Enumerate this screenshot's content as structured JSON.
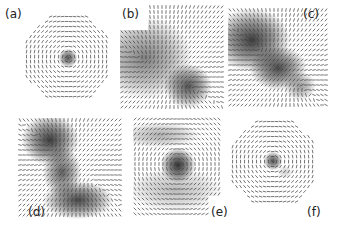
{
  "figure": {
    "panels": [
      {
        "id": "a",
        "label": "(a)",
        "shape": "octagon",
        "cx": 68,
        "cy": 58,
        "r": 47,
        "label_x": 5,
        "label_y": 8,
        "blobs": [
          {
            "x": 68,
            "y": 58,
            "rx": 6,
            "ry": 6,
            "a": 0.75
          }
        ],
        "vortices": [
          {
            "x": 68,
            "y": 58,
            "s": 1
          }
        ]
      },
      {
        "id": "b",
        "label": "(b)",
        "shape": "notched",
        "x0": 120,
        "y0": 5,
        "x1": 225,
        "y1": 110,
        "notch_x": 148,
        "notch_y": 30,
        "label_x": 122,
        "label_y": 8,
        "blobs": [
          {
            "x": 145,
            "y": 58,
            "rx": 30,
            "ry": 26,
            "a": 0.55
          },
          {
            "x": 188,
            "y": 86,
            "rx": 15,
            "ry": 14,
            "a": 0.75
          }
        ],
        "vortices": [
          {
            "x": 188,
            "y": 86,
            "s": 1
          },
          {
            "x": 145,
            "y": 60,
            "s": -1
          }
        ]
      },
      {
        "id": "c",
        "label": "(c)",
        "shape": "rect",
        "x0": 228,
        "y0": 8,
        "x1": 330,
        "y1": 108,
        "label_x": 303,
        "label_y": 8,
        "blobs": [
          {
            "x": 252,
            "y": 40,
            "rx": 24,
            "ry": 20,
            "a": 0.85
          },
          {
            "x": 278,
            "y": 68,
            "rx": 18,
            "ry": 14,
            "a": 0.8
          },
          {
            "x": 300,
            "y": 86,
            "rx": 10,
            "ry": 9,
            "a": 0.45
          }
        ],
        "vortices": [
          {
            "x": 262,
            "y": 52,
            "s": 1
          },
          {
            "x": 300,
            "y": 86,
            "s": -1
          }
        ]
      },
      {
        "id": "d",
        "label": "(d)",
        "shape": "rect",
        "x0": 18,
        "y0": 118,
        "x1": 122,
        "y1": 220,
        "label_x": 28,
        "label_y": 206,
        "blobs": [
          {
            "x": 50,
            "y": 140,
            "rx": 18,
            "ry": 16,
            "a": 0.85
          },
          {
            "x": 62,
            "y": 172,
            "rx": 12,
            "ry": 16,
            "a": 0.7
          },
          {
            "x": 78,
            "y": 200,
            "rx": 22,
            "ry": 12,
            "a": 0.8
          }
        ],
        "vortices": [
          {
            "x": 52,
            "y": 148,
            "s": 1
          },
          {
            "x": 90,
            "y": 180,
            "s": -1
          }
        ]
      },
      {
        "id": "e",
        "label": "(e)",
        "shape": "notched_br",
        "x0": 133,
        "y0": 117,
        "x1": 223,
        "y1": 218,
        "notch_x": 208,
        "notch_y": 196,
        "label_x": 211,
        "label_y": 206,
        "blobs": [
          {
            "x": 178,
            "y": 165,
            "rx": 11,
            "ry": 11,
            "a": 0.9
          },
          {
            "x": 160,
            "y": 135,
            "rx": 25,
            "ry": 8,
            "a": 0.35
          },
          {
            "x": 175,
            "y": 190,
            "rx": 30,
            "ry": 14,
            "a": 0.3
          }
        ],
        "vortices": [
          {
            "x": 178,
            "y": 165,
            "s": 1
          }
        ]
      },
      {
        "id": "f",
        "label": "(f)",
        "shape": "octagon",
        "cx": 274,
        "cy": 163,
        "r": 47,
        "label_x": 307,
        "label_y": 206,
        "blobs": [
          {
            "x": 273,
            "y": 161,
            "rx": 6,
            "ry": 6,
            "a": 0.75
          },
          {
            "x": 285,
            "y": 172,
            "rx": 5,
            "ry": 4,
            "a": 0.2
          }
        ],
        "vortices": [
          {
            "x": 273,
            "y": 161,
            "s": 1
          }
        ]
      }
    ],
    "arrow_spacing": 5,
    "arrow_color": "#3a3a3a",
    "blob_color": "#1a1a1a"
  }
}
